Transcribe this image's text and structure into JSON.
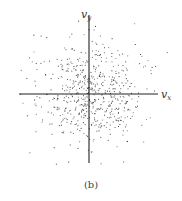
{
  "figure": {
    "caption": "(b)",
    "x_axis_label": {
      "main": "v",
      "sub": "x"
    },
    "y_axis_label": {
      "main": "v",
      "sub": "y"
    }
  },
  "colors": {
    "axis": "#222222",
    "point": "#333333",
    "background": "#ffffff"
  },
  "chart_data": {
    "type": "scatter",
    "title": "",
    "caption": "(b)",
    "xlabel": "v_x",
    "ylabel": "v_y",
    "origin_px": [
      89,
      94
    ],
    "x_axis_px_range": [
      19,
      158
    ],
    "y_axis_px_range": [
      15,
      163
    ],
    "point_count_approx": 600,
    "spread_sigma_px": 26,
    "grid": false,
    "legend": null
  }
}
